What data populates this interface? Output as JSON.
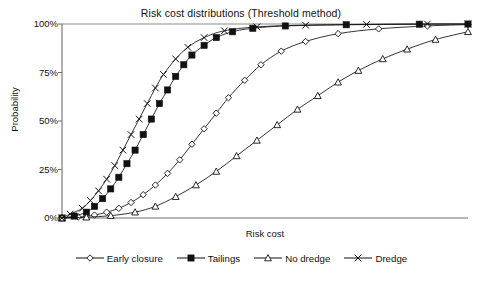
{
  "chart_data": {
    "type": "line",
    "title": "Risk cost distributions (Threshold method)",
    "xlabel": "Risk cost",
    "ylabel": "Probability",
    "ylim": [
      0,
      100
    ],
    "xlim": [
      0,
      100
    ],
    "grid": false,
    "legend_position": "bottom",
    "ytick_labels": [
      "100%",
      "75%",
      "50%",
      "25%",
      "0%"
    ],
    "ytick_values": [
      100,
      75,
      50,
      25,
      0
    ],
    "xtick_labels": [],
    "series": [
      {
        "name": "Early closure",
        "marker": "open-diamond",
        "x": [
          0,
          4,
          8,
          11,
          14,
          17,
          20,
          23,
          26,
          29,
          32,
          35,
          38,
          41,
          45,
          49,
          54,
          60,
          68,
          78,
          90,
          100
        ],
        "values": [
          0,
          0.5,
          1.5,
          3,
          5,
          8,
          12,
          17,
          23,
          30,
          38,
          46,
          54,
          62,
          71,
          79,
          86,
          91,
          95,
          97.5,
          99,
          99.7
        ]
      },
      {
        "name": "Tailings",
        "marker": "filled-square",
        "x": [
          0,
          3,
          6,
          8,
          10,
          12,
          14,
          16,
          18,
          20,
          22,
          24,
          26,
          28,
          30,
          32,
          35,
          38,
          42,
          47,
          55,
          70,
          88,
          100
        ],
        "values": [
          0,
          1,
          3,
          6,
          10,
          15,
          21,
          28,
          35,
          43,
          51,
          59,
          66,
          73,
          79,
          84,
          89,
          93,
          96,
          97.8,
          99,
          99.6,
          99.9,
          100
        ]
      },
      {
        "name": "No dredge",
        "marker": "open-triangle",
        "x": [
          0,
          6,
          12,
          18,
          23,
          28,
          33,
          38,
          43,
          48,
          53,
          58,
          63,
          68,
          73,
          79,
          85,
          92,
          100
        ],
        "values": [
          0,
          0.4,
          1.2,
          3,
          6,
          11,
          17,
          24,
          32,
          40,
          48,
          56,
          63,
          70,
          76,
          82,
          87,
          92,
          96
        ]
      },
      {
        "name": "Dredge",
        "marker": "cross-x",
        "x": [
          0,
          2,
          5,
          7,
          9,
          11,
          13,
          15,
          17,
          19,
          21,
          23,
          25,
          28,
          31,
          35,
          40,
          48,
          60,
          75,
          90,
          100
        ],
        "values": [
          0,
          2,
          5,
          9,
          14,
          20,
          27,
          35,
          43,
          51,
          59,
          67,
          74,
          82,
          88,
          93,
          96.5,
          98.5,
          99.4,
          99.8,
          100,
          100
        ]
      }
    ]
  },
  "legend": {
    "items": [
      {
        "label": "Early closure",
        "marker": "open-diamond"
      },
      {
        "label": "Tailings",
        "marker": "filled-square"
      },
      {
        "label": "No dredge",
        "marker": "open-triangle"
      },
      {
        "label": "Dredge",
        "marker": "cross-x"
      }
    ]
  },
  "caption": {
    "text": ""
  }
}
